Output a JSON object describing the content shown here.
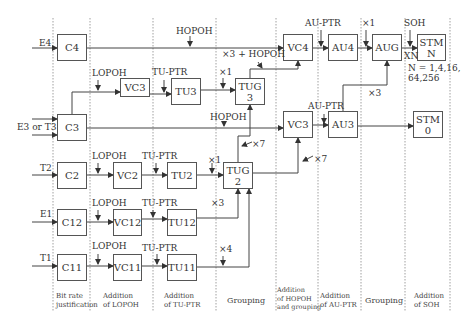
{
  "diagram": {
    "inputs": [
      {
        "id": "E4",
        "label": "E4"
      },
      {
        "id": "E3T3",
        "label": "E3 or T3"
      },
      {
        "id": "T2",
        "label": "T2"
      },
      {
        "id": "E1",
        "label": "E1"
      },
      {
        "id": "T1",
        "label": "T1"
      }
    ],
    "boxes": {
      "C4": "C4",
      "C3": "C3",
      "C2": "C2",
      "C12": "C12",
      "C11": "C11",
      "VC3_low": "VC3",
      "VC2": "VC2",
      "VC12": "VC12",
      "VC11": "VC11",
      "TU3": "TU3",
      "TU2": "TU2",
      "TU12": "TU12",
      "TU11": "TU11",
      "TUG3": "TUG\n3",
      "TUG2": "TUG\n2",
      "VC4": "VC4",
      "VC3_high": "VC3",
      "AU4": "AU4",
      "AU3": "AU3",
      "AUG": "AUG",
      "STMN": "STM\nN",
      "STM0": "STM\n0"
    },
    "annotations": {
      "hopoh_top": "HOPOH",
      "x3_hopoh": "×3 + HOPOH",
      "lopoh_vc3": "LOPOH",
      "tuptr_tu3": "TU-PTR",
      "x1_tug3": "×1",
      "hopoh_mid": "HOPOH",
      "lopoh_vc2": "LOPOH",
      "tuptr_tu2": "TU-PTR",
      "x1_tug2": "×1",
      "x7_tug3": "×7",
      "x7_vc3": "×7",
      "lopoh_vc12": "LOPOH",
      "tuptr_tu12": "TU-PTR",
      "x3_tu12": "×3",
      "lopoh_vc11": "LOPOH",
      "tuptr_tu11": "TU-PTR",
      "x4_tu11": "×4",
      "auptr_au4": "AU-PTR",
      "x1_aug": "×1",
      "soh": "SOH",
      "xn": "XN",
      "n_values": "N = 1,4,16,\n64,256",
      "auptr_au3": "AU-PTR",
      "x3_aug": "×3"
    },
    "stages": [
      "Bit rate\njustification",
      "Addition\nof LOPOH",
      "Addition\nof TU-PTR",
      "Grouping",
      "Addition\nof HOPOH\nand grouping",
      "Addition\nof AU-PTR",
      "Grouping",
      "Addition\nof SOH"
    ]
  }
}
